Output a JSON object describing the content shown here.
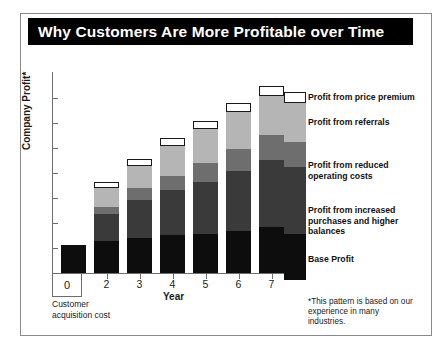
{
  "title": "Why Customers Are More Profitable over Time",
  "axes": {
    "y_title": "Company Profit*",
    "x_title": "Year",
    "x_labels": [
      "1",
      "2",
      "3",
      "4",
      "5",
      "6",
      "7"
    ],
    "zero_label": "0",
    "zero_note": "Customer acquisition cost"
  },
  "legend": {
    "items": [
      {
        "label": "Profit from price premium",
        "key": "premium",
        "color": "#ffffff"
      },
      {
        "label": "Profit from referrals",
        "key": "referrals",
        "color": "#b5b5b5"
      },
      {
        "label": "Profit from reduced\noperating costs",
        "key": "costs",
        "color": "#6e6e6e"
      },
      {
        "label": "Profit from increased\npurchases and higher\nbalances",
        "key": "purchases",
        "color": "#3a3a3a"
      },
      {
        "label": "Base Profit",
        "key": "base",
        "color": "#0d0d0d"
      }
    ]
  },
  "footnote": "*This pattern is based on our experience in many industries.",
  "colors": {
    "banner_background": "#000000",
    "banner_text": "#ffffff",
    "frame_border": "#8a8a8a",
    "axis": "#6e6e6e"
  },
  "chart_data": {
    "type": "bar",
    "stacked": true,
    "title": "Why Customers Are More Profitable over Time",
    "xlabel": "Year",
    "ylabel": "Company Profit*",
    "categories": [
      "1",
      "2",
      "3",
      "4",
      "5",
      "6",
      "7"
    ],
    "ylim": [
      0,
      200
    ],
    "grid": false,
    "legend_position": "right",
    "series": [
      {
        "name": "Base Profit",
        "color": "#0d0d0d",
        "values": [
          33,
          38,
          42,
          45,
          47,
          50,
          55
        ]
      },
      {
        "name": "Profit from increased purchases and higher balances",
        "color": "#3a3a3a",
        "values": [
          0,
          32,
          45,
          54,
          62,
          72,
          80
        ]
      },
      {
        "name": "Profit from reduced operating costs",
        "color": "#6e6e6e",
        "values": [
          0,
          9,
          14,
          17,
          22,
          26,
          30
        ]
      },
      {
        "name": "Profit from referrals",
        "color": "#b5b5b5",
        "values": [
          0,
          23,
          27,
          36,
          41,
          44,
          46
        ]
      },
      {
        "name": "Profit from price premium",
        "color": "#ffffff",
        "values": [
          0,
          7,
          8,
          9,
          10,
          11,
          12
        ]
      }
    ],
    "totals": [
      33,
      109,
      136,
      161,
      182,
      203,
      223
    ],
    "annotations": [
      "0 = Customer acquisition cost",
      "*This pattern is based on our experience in many industries."
    ]
  }
}
